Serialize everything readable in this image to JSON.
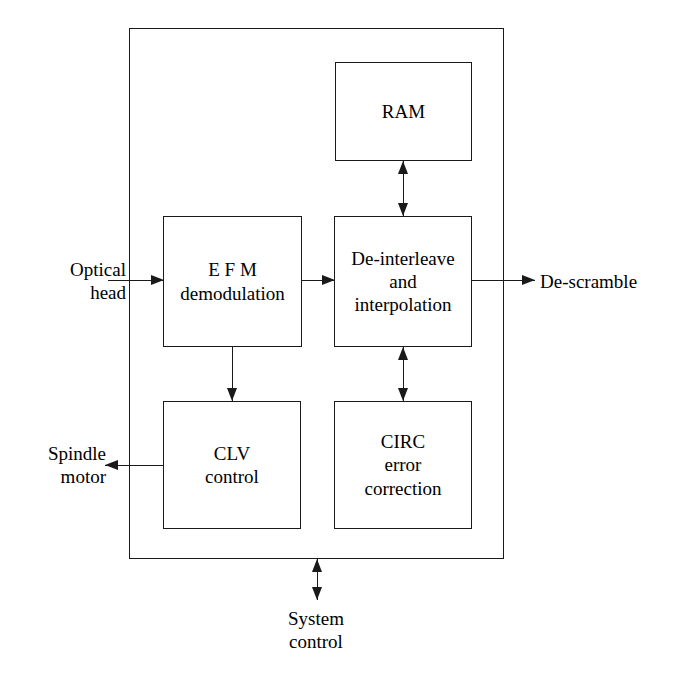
{
  "diagram": {
    "type": "block-diagram",
    "background_color": "#ffffff",
    "line_color": "#1a1a1a",
    "outer_block": {
      "name": "system-boundary",
      "label": ""
    },
    "blocks": [
      {
        "id": "ram",
        "label": "RAM"
      },
      {
        "id": "efm",
        "label": "E F M\ndemodulation"
      },
      {
        "id": "deinterleave",
        "label": "De-interleave\nand\ninterpolation"
      },
      {
        "id": "clv",
        "label": "CLV\ncontrol"
      },
      {
        "id": "circ",
        "label": "CIRC\nerror\ncorrection"
      }
    ],
    "external_labels": [
      {
        "id": "optical-head",
        "label": "Optical\nhead",
        "align": "right"
      },
      {
        "id": "spindle-motor",
        "label": "Spindle\nmotor",
        "align": "right"
      },
      {
        "id": "de-scramble",
        "label": "De-scramble",
        "align": "left"
      },
      {
        "id": "system-control",
        "label": "System\ncontrol",
        "align": "center"
      }
    ],
    "connections": [
      {
        "id": "optical-head-to-efm",
        "from": "optical-head",
        "to": "efm",
        "direction": "right",
        "arrowheads": 1
      },
      {
        "id": "efm-to-deinterleave",
        "from": "efm",
        "to": "deinterleave",
        "direction": "right",
        "arrowheads": 1
      },
      {
        "id": "deinterleave-to-descramble",
        "from": "deinterleave",
        "to": "de-scramble",
        "direction": "right",
        "arrowheads": 1
      },
      {
        "id": "ram-to-deinterleave",
        "from": "ram",
        "to": "deinterleave",
        "direction": "bidirectional",
        "arrowheads": 2
      },
      {
        "id": "deinterleave-to-circ",
        "from": "deinterleave",
        "to": "circ",
        "direction": "bidirectional",
        "arrowheads": 2
      },
      {
        "id": "efm-to-clv",
        "from": "efm",
        "to": "clv",
        "direction": "down",
        "arrowheads": 1
      },
      {
        "id": "clv-to-spindle-motor",
        "from": "clv",
        "to": "spindle-motor",
        "direction": "left",
        "arrowheads": 1
      },
      {
        "id": "system-control-to-boundary",
        "from": "system-control",
        "to": "system-boundary",
        "direction": "bidirectional",
        "arrowheads": 2
      }
    ]
  }
}
